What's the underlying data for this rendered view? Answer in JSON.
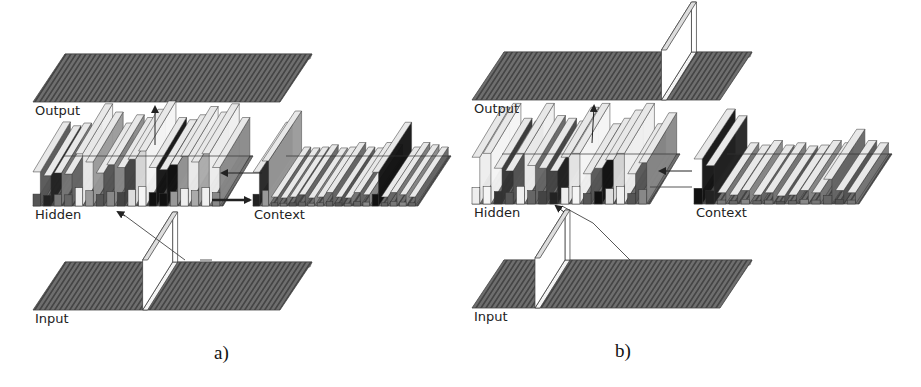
{
  "figure": {
    "panels": [
      {
        "id": "a",
        "caption": "a)",
        "labels": {
          "output": "Output",
          "hidden": "Hidden",
          "context": "Context",
          "input": "Input"
        },
        "input_active_unit": 0.46,
        "output_active_unit": null,
        "hidden_bars": [
          "#555",
          "#222",
          "#777",
          "#666",
          "#eee",
          "#999",
          "#555",
          "#888",
          "#444",
          "#ddd",
          "#f5f5f5",
          "#111",
          "#111",
          "#999",
          "#eee",
          "#aaa",
          "#f0f0f0",
          "#888"
        ],
        "hidden_heights": [
          0.62,
          0.55,
          0.6,
          0.58,
          0.95,
          0.8,
          0.6,
          0.75,
          0.7,
          0.85,
          1.0,
          0.7,
          0.66,
          0.75,
          0.9,
          0.8,
          0.95,
          0.7
        ],
        "context_bars": [
          "#222",
          "#999",
          "#666",
          "#777",
          "#555",
          "#666",
          "#888",
          "#777",
          "#666",
          "#555",
          "#777",
          "#666",
          "#888",
          "#111",
          "#666",
          "#777",
          "#888",
          "#666"
        ],
        "context_heights": [
          0.75,
          1.0,
          0.2,
          0.18,
          0.2,
          0.25,
          0.18,
          0.2,
          0.3,
          0.2,
          0.18,
          0.3,
          0.25,
          0.75,
          0.2,
          0.3,
          0.25,
          0.2
        ],
        "copy_arrow": "hidden-to-context",
        "feedback_arrow": "context-to-hidden"
      },
      {
        "id": "b",
        "caption": "b)",
        "labels": {
          "output": "Output",
          "hidden": "Hidden",
          "context": "Context",
          "input": "Input"
        },
        "input_active_unit": 0.27,
        "output_active_unit": 0.78,
        "hidden_bars": [
          "#eee",
          "#f5f5f5",
          "#333",
          "#555",
          "#f0f0f0",
          "#666",
          "#444",
          "#222",
          "#eee",
          "#f5f5f5",
          "#555",
          "#111",
          "#ddd",
          "#f0f0f0",
          "#555",
          "#888"
        ],
        "hidden_heights": [
          0.85,
          0.92,
          0.65,
          0.6,
          0.92,
          0.7,
          0.65,
          0.6,
          0.85,
          0.92,
          0.55,
          0.65,
          0.8,
          0.92,
          0.55,
          0.75
        ],
        "context_bars": [
          "#111",
          "#222",
          "#777",
          "#666",
          "#888",
          "#666",
          "#777",
          "#555",
          "#666",
          "#888",
          "#777",
          "#666",
          "#555",
          "#777"
        ],
        "context_heights": [
          1.0,
          0.85,
          0.25,
          0.2,
          0.3,
          0.2,
          0.25,
          0.18,
          0.2,
          0.3,
          0.25,
          0.55,
          0.3,
          0.25
        ],
        "copy_arrow": "hidden-to-context",
        "feedback_arrow": "context-to-hidden"
      }
    ],
    "colors": {
      "slab_fill": "#6e6e6e",
      "slab_hatch": "#2e2e2e",
      "slab_top_edge": "#a9a9a9",
      "active_unit": "#ffffff",
      "arrow": "#222222",
      "connection": "#444444"
    }
  }
}
